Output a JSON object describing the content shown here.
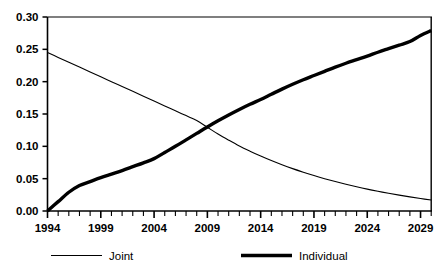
{
  "chart_data": {
    "type": "line",
    "title": "",
    "subtitle": "",
    "xlabel": "",
    "ylabel": "",
    "xlim": [
      1994,
      2030
    ],
    "ylim": [
      0.0,
      0.3
    ],
    "grid": false,
    "legend_position": "bottom",
    "x_tick_labels": [
      "1994",
      "1999",
      "2004",
      "2009",
      "2014",
      "2019",
      "2024",
      "2029"
    ],
    "x_tick_values": [
      1994,
      1999,
      2004,
      2009,
      2014,
      2019,
      2024,
      2029
    ],
    "x_minor_tick_step": 1,
    "y_tick_labels": [
      "0.00",
      "0.05",
      "0.10",
      "0.15",
      "0.20",
      "0.25",
      "0.30"
    ],
    "y_tick_values": [
      0.0,
      0.05,
      0.1,
      0.15,
      0.2,
      0.25,
      0.3
    ],
    "x": [
      1994,
      1995,
      1996,
      1997,
      1998,
      1999,
      2000,
      2001,
      2002,
      2003,
      2004,
      2005,
      2006,
      2007,
      2008,
      2009,
      2010,
      2011,
      2012,
      2013,
      2014,
      2015,
      2016,
      2017,
      2018,
      2019,
      2020,
      2021,
      2022,
      2023,
      2024,
      2025,
      2026,
      2027,
      2028,
      2029,
      2030
    ],
    "series": [
      {
        "name": "Joint",
        "line_style": "thin",
        "color": "#000000",
        "line_width": 1.1,
        "values": [
          0.245,
          0.2375,
          0.23,
          0.2225,
          0.215,
          0.2075,
          0.2,
          0.1925,
          0.185,
          0.1775,
          0.17,
          0.1625,
          0.155,
          0.1475,
          0.14,
          0.1295,
          0.119,
          0.1095,
          0.1005,
          0.0925,
          0.085,
          0.078,
          0.0715,
          0.0655,
          0.06,
          0.0548,
          0.05,
          0.0455,
          0.0413,
          0.0374,
          0.0338,
          0.0305,
          0.0274,
          0.0245,
          0.0218,
          0.0193,
          0.017
        ]
      },
      {
        "name": "Individual",
        "line_style": "thick",
        "color": "#000000",
        "line_width": 3.4,
        "values": [
          0.0,
          0.0145,
          0.029,
          0.0395,
          0.0455,
          0.0515,
          0.057,
          0.0625,
          0.0685,
          0.0745,
          0.081,
          0.0905,
          0.1,
          0.11,
          0.12,
          0.13,
          0.1395,
          0.1485,
          0.157,
          0.165,
          0.1725,
          0.1805,
          0.1885,
          0.196,
          0.203,
          0.2095,
          0.216,
          0.2225,
          0.2285,
          0.234,
          0.2395,
          0.2455,
          0.251,
          0.2565,
          0.262,
          0.2715,
          0.279
        ]
      }
    ],
    "annotations": {
      "crossover_year": 2009,
      "crossover_value": 0.128
    }
  },
  "legend": {
    "items": [
      {
        "label": "Joint",
        "style": "thin"
      },
      {
        "label": "Individual",
        "style": "thick"
      }
    ]
  }
}
